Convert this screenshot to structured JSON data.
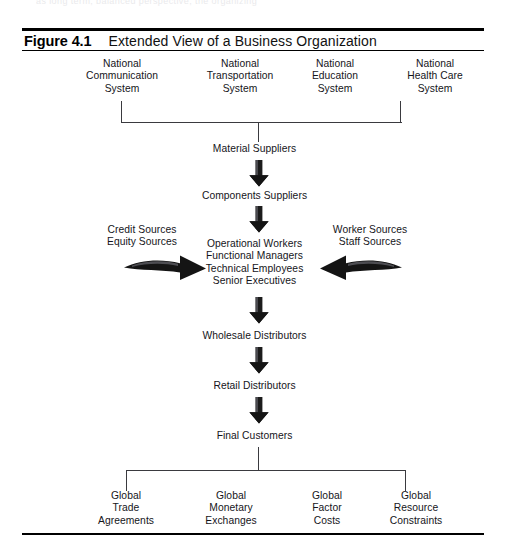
{
  "page": {
    "bleed_text": "as long term, balanced perspective,  the organizing"
  },
  "figure": {
    "label": "Figure 4.1",
    "title": "Extended View of a Business Organization"
  },
  "diagram": {
    "type": "flow-diagram",
    "title": "Extended View of a Business Organization",
    "top_row": [
      {
        "id": "national-communication-system",
        "text": "National\nCommunication\nSystem"
      },
      {
        "id": "national-transportation-system",
        "text": "National\nTransportation\nSystem"
      },
      {
        "id": "national-education-system",
        "text": "National\nEducation\nSystem"
      },
      {
        "id": "national-health-care-system",
        "text": "National\nHealth Care\nSystem"
      }
    ],
    "chain": [
      {
        "id": "material-suppliers",
        "text": "Material Suppliers"
      },
      {
        "id": "components-suppliers",
        "text": "Components Suppliers"
      },
      {
        "id": "core-organization",
        "text": "Operational Workers\nFunctional Managers\nTechnical Employees\nSenior Executives"
      },
      {
        "id": "wholesale-distributors",
        "text": "Wholesale Distributors"
      },
      {
        "id": "retail-distributors",
        "text": "Retail Distributors"
      },
      {
        "id": "final-customers",
        "text": "Final Customers"
      }
    ],
    "left_input": {
      "id": "capital-sources",
      "text": "Credit Sources\nEquity Sources"
    },
    "right_input": {
      "id": "labor-sources",
      "text": "Worker Sources\nStaff Sources"
    },
    "bottom_row": [
      {
        "id": "global-trade-agreements",
        "text": "Global\nTrade\nAgreements"
      },
      {
        "id": "global-monetary-exchanges",
        "text": "Global\nMonetary\nExchanges"
      },
      {
        "id": "global-factor-costs",
        "text": "Global\nFactor\nCosts"
      },
      {
        "id": "global-resource-constraints",
        "text": "Global\nResource\nConstraints"
      }
    ],
    "colors": {
      "ink": "#15151a",
      "rule": "#000000",
      "connector": "#3a3a3f",
      "arrow": "#1c1c1c",
      "background": "#ffffff"
    }
  }
}
